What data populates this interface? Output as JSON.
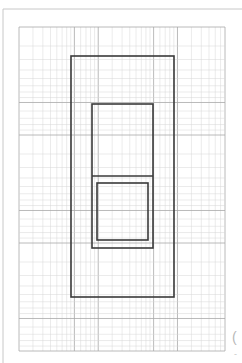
{
  "page": {
    "width": 242,
    "height": 363,
    "background": "#ffffff",
    "scan_border": {
      "x": 3,
      "y": 9,
      "color": "#c8c8c8"
    }
  },
  "graph_paper": {
    "type": "log-log",
    "area": {
      "x": 19,
      "y": 27,
      "width": 206,
      "height": 324
    },
    "x_decades": 2.6,
    "y_decades": 3,
    "minor_color": "#d6d6d6",
    "major_color": "#a8a8a8"
  },
  "shapes": [
    {
      "name": "outer-rectangle",
      "x": 71,
      "y": 56,
      "width": 103,
      "height": 241,
      "stroke": "#3a3a3a",
      "stroke_width": 1.6
    },
    {
      "name": "inner-tall-rectangle",
      "x": 92,
      "y": 104,
      "width": 61,
      "height": 144,
      "stroke": "#3a3a3a",
      "stroke_width": 1.6
    },
    {
      "name": "divider-line",
      "x1": 92,
      "y1": 176,
      "x2": 153,
      "y2": 176,
      "stroke": "#3a3a3a",
      "stroke_width": 1.6
    },
    {
      "name": "inner-square",
      "x": 97,
      "y": 183,
      "width": 51,
      "height": 57,
      "stroke": "#3a3a3a",
      "stroke_width": 1.6
    }
  ],
  "edge_text": {
    "glyph": "(",
    "mark": "-"
  }
}
